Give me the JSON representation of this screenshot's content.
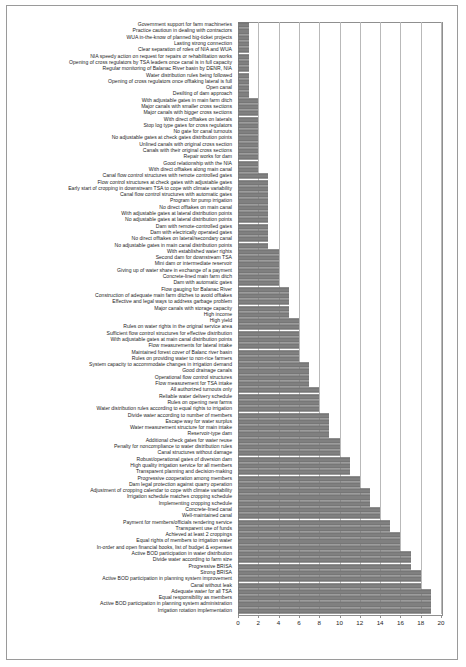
{
  "chart_data": {
    "type": "bar",
    "orientation": "horizontal",
    "title": "",
    "xlabel": "",
    "ylabel": "",
    "xlim": [
      0,
      20
    ],
    "xticks": [
      0,
      2,
      4,
      6,
      8,
      10,
      12,
      14,
      16,
      18,
      20
    ],
    "grid": "vertical",
    "legend": "none",
    "bar_color": "#808080",
    "categories": [
      "Government support for farm machineries",
      "Practice cautioun in dealing with contractors",
      "WUA in-the-know of planned big-ticket projects",
      "Lasting strong connection",
      "Clear separation of roles of NIA and WUA",
      "NIA speedy action on request for repairs or rehabilitation works",
      "Opening of cross regulators by TSA leaders once canal is in full capacity",
      "Regular monitoring of Balanac River basin by DENR, NIA",
      "Water distribution rules being followed",
      "Opening of cross regulators once offtaking lateral is full",
      "Open canal",
      "Desilting of dam approach",
      "With adjustable gates in main farm ditch",
      "Major canals with smaller cross sections",
      "Major canals with bigger cross sections",
      "With direct offtakes on laterals",
      "Stop log type gates for cross regulators",
      "No gate for canal turnouts",
      "No adjustable gates at check gates distribution points",
      "Unlined canals with original cross section",
      "Canals with their original cross sections",
      "Repair works for dam",
      "Good relationship with the NIA",
      "With direct offtakes along main canal",
      "Canal flow control structures with remote controlled gates",
      "Flow control structures at check gates with adjustable gates",
      "Early start of cropping in downstream TSA to cope with climate variability",
      "Canal flow control structures with automatic gates",
      "Program for pump irrigation",
      "No direct offtakes on main canal",
      "With adjustable gates at lateral distribution points",
      "No adjustable gates at lateral distribution points",
      "Dam with remote-controlled gates",
      "Dam with electrically operated gates",
      "No direct offtakes on lateral/secondary canal",
      "No adjustable gates in main canal distribution points",
      "With established water rights",
      "Second dam for downstream TSA",
      "Mini dam or intermediate reservoir",
      "Giving up of water share in exchange of a payment",
      "Concrete-lined main farm ditch",
      "Dam with automatic gates",
      "Flow gauging for Balanac River",
      "Construction of adequate main farm ditches to avoid offtakes",
      "Effective and legal ways to address garbage problem",
      "Major canals with storage capacity",
      "High income",
      "High yield",
      "Rules on water rights in the original service area",
      "Sufficient flow control structures for effective distribution",
      "With adjustable gates at main canal distribution points",
      "Flow measurements for lateral intake",
      "Maintained forest cover of Balanc river basin",
      "Rules on providing water to non-rice farmers",
      "System capacity to accommodate changes in irrigation demand",
      "Good drainage canals",
      "Operational flow control structures",
      "Flow measurement for TSA intake",
      "All authorized turnouts only",
      "Reliable water delivery schedule",
      "Rules on opening new farms",
      "Water distribution rules according to equal rights to irrigation",
      "Divide water according to number of members",
      "Escape way for water surplus",
      "Water measurement structure for main intake",
      "Reservoir-type dam",
      "Additional check gates for water reuse",
      "Penalty for noncompliance to water distribution rules",
      "Canal structures without damage",
      "Robust/operational gates of diversion dam",
      "High quality irrigation service for all members",
      "Transparent planning and decision-making",
      "Progressive cooperation among members",
      "Dam legal protection against quarry operation",
      "Adjustment of cropping calendar to cope with climate variability",
      "Irrigation schedule matches cropping schedule",
      "Implementing cropping schedule",
      "Concrete-lined canal",
      "Well-maintained canal",
      "Payment for members/officials rendering service",
      "Transparent use of funds",
      "Achieved at least 2 croppings",
      "Equal rights of members to irrigation water",
      "In-order and open financial books, list of budget & expenses",
      "Active BOD participation in water distribution",
      "Divide water according to farm size",
      "Progressive BRISA",
      "Strong BRISA",
      "Active BOD participation in planning system improvement",
      "Canal without leak",
      "Adequate water for all TSA",
      "Equal responsibility as members",
      "Active BOD participation in planning system administration",
      "Irrigation rotation implementation"
    ],
    "values": [
      1.1,
      1.1,
      1.1,
      1.1,
      1.1,
      1.1,
      1.1,
      1.1,
      1.1,
      1.1,
      1.1,
      1.1,
      2.0,
      2.0,
      2.0,
      2.0,
      2.0,
      2.0,
      2.0,
      2.0,
      2.0,
      2.0,
      2.0,
      2.0,
      3.0,
      3.0,
      3.0,
      3.0,
      3.0,
      3.0,
      3.0,
      3.0,
      3.0,
      3.0,
      3.0,
      3.0,
      4.0,
      4.0,
      4.0,
      4.0,
      4.0,
      4.0,
      5.0,
      5.0,
      5.0,
      5.0,
      5.0,
      6.0,
      6.0,
      6.0,
      6.0,
      6.0,
      6.0,
      6.0,
      7.0,
      7.0,
      7.0,
      7.0,
      8.0,
      8.0,
      8.0,
      8.0,
      9.0,
      9.0,
      9.0,
      9.0,
      10.0,
      10.0,
      10.0,
      11.0,
      11.0,
      11.0,
      12.0,
      12.0,
      13.0,
      13.0,
      13.0,
      14.0,
      14.0,
      15.0,
      15.0,
      16.0,
      16.0,
      16.0,
      17.0,
      17.0,
      17.0,
      18.0,
      18.0,
      18.0,
      19.0,
      19.0,
      19.0,
      19.0
    ]
  }
}
